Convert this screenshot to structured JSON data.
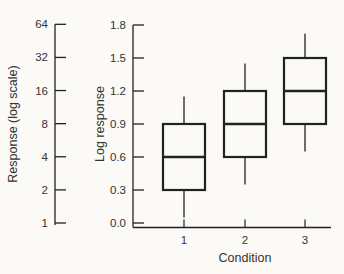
{
  "figure": {
    "background": "#fbfaf7",
    "line_color": "#222222",
    "text_color": "#333333"
  },
  "chart_data": {
    "type": "boxplot",
    "title": "",
    "xlabel": "Condition",
    "categories": [
      "1",
      "2",
      "3"
    ],
    "left_axis": {
      "label": "Response (log scale)",
      "scale": "log",
      "tick_labels": [
        "1",
        "2",
        "4",
        "8",
        "16",
        "32",
        "64"
      ],
      "tick_values": [
        1,
        2,
        4,
        8,
        16,
        32,
        64
      ]
    },
    "y_axis": {
      "label": "Log response",
      "tick_labels": [
        "0.0",
        "0.3",
        "0.6",
        "0.9",
        "1.2",
        "1.5",
        "1.8"
      ],
      "tick_values": [
        0.0,
        0.3,
        0.6,
        0.9,
        1.2,
        1.5,
        1.8
      ],
      "ylim": [
        0.0,
        1.8
      ]
    },
    "boxes": [
      {
        "category": "1",
        "whisker_low": 0.05,
        "q1": 0.3,
        "median": 0.6,
        "q3": 0.9,
        "whisker_high": 1.15
      },
      {
        "category": "2",
        "whisker_low": 0.35,
        "q1": 0.6,
        "median": 0.9,
        "q3": 1.2,
        "whisker_high": 1.45
      },
      {
        "category": "3",
        "whisker_low": 0.65,
        "q1": 0.9,
        "median": 1.2,
        "q3": 1.5,
        "whisker_high": 1.72
      }
    ],
    "grid": false,
    "legend": null
  }
}
